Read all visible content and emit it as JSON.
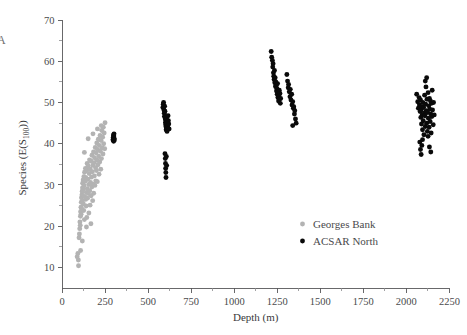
{
  "panel": {
    "label": "A"
  },
  "chart_data": {
    "type": "scatter",
    "title": "",
    "xlabel": "Depth (m)",
    "ylabel_main": "Species (E(S",
    "ylabel_sub": "100",
    "ylabel_tail": "))",
    "ylabel_full": "Species (E(S100))",
    "xlim": [
      0,
      2300
    ],
    "ylim": [
      5,
      71
    ],
    "grid": false,
    "legend_position": "inside-lower-right",
    "xticks": [
      0,
      250,
      500,
      750,
      1000,
      1250,
      1500,
      1750,
      2000,
      2250
    ],
    "xtick_labels": [
      "0",
      "250",
      "500",
      "750",
      "1000",
      "1250",
      "1500",
      "1750",
      "2000",
      "2250"
    ],
    "yticks": [
      10,
      20,
      30,
      40,
      50,
      60,
      70
    ],
    "ytick_labels": [
      "10",
      "20",
      "30",
      "40",
      "50",
      "60",
      "70"
    ],
    "yminor": [
      15,
      25,
      35,
      45,
      55,
      65
    ],
    "series": [
      {
        "name": "Georges Bank",
        "color": "#b3b3b3",
        "marker": "circle",
        "points": [
          [
            88,
            12.6
          ],
          [
            92,
            13.4
          ],
          [
            96,
            10.4
          ],
          [
            99,
            17.2
          ],
          [
            101,
            18.1
          ],
          [
            103,
            19.4
          ],
          [
            104,
            21.0
          ],
          [
            106,
            20.2
          ],
          [
            107,
            22.4
          ],
          [
            108,
            23.5
          ],
          [
            110,
            24.6
          ],
          [
            111,
            22.9
          ],
          [
            112,
            25.8
          ],
          [
            113,
            26.9
          ],
          [
            114,
            24.2
          ],
          [
            116,
            27.6
          ],
          [
            117,
            28.4
          ],
          [
            118,
            26.1
          ],
          [
            119,
            29.3
          ],
          [
            120,
            30.4
          ],
          [
            122,
            28.9
          ],
          [
            123,
            31.2
          ],
          [
            124,
            25.4
          ],
          [
            126,
            23.8
          ],
          [
            127,
            32.0
          ],
          [
            128,
            29.8
          ],
          [
            130,
            21.6
          ],
          [
            131,
            33.1
          ],
          [
            132,
            27.2
          ],
          [
            134,
            30.9
          ],
          [
            136,
            34.0
          ],
          [
            137,
            26.5
          ],
          [
            138,
            31.8
          ],
          [
            140,
            24.9
          ],
          [
            141,
            28.2
          ],
          [
            143,
            33.6
          ],
          [
            144,
            22.1
          ],
          [
            146,
            35.2
          ],
          [
            147,
            29.1
          ],
          [
            148,
            26.8
          ],
          [
            150,
            31.4
          ],
          [
            152,
            34.6
          ],
          [
            153,
            27.9
          ],
          [
            155,
            30.1
          ],
          [
            156,
            23.2
          ],
          [
            158,
            32.8
          ],
          [
            160,
            36.1
          ],
          [
            161,
            28.6
          ],
          [
            163,
            25.1
          ],
          [
            164,
            33.9
          ],
          [
            166,
            30.6
          ],
          [
            168,
            35.8
          ],
          [
            169,
            27.4
          ],
          [
            171,
            31.9
          ],
          [
            173,
            29.5
          ],
          [
            174,
            37.2
          ],
          [
            176,
            33.2
          ],
          [
            178,
            26.2
          ],
          [
            179,
            34.8
          ],
          [
            181,
            30.2
          ],
          [
            183,
            38.0
          ],
          [
            184,
            28.0
          ],
          [
            186,
            35.4
          ],
          [
            188,
            32.2
          ],
          [
            189,
            36.6
          ],
          [
            191,
            29.9
          ],
          [
            193,
            39.1
          ],
          [
            195,
            34.2
          ],
          [
            196,
            31.0
          ],
          [
            198,
            37.8
          ],
          [
            200,
            33.5
          ],
          [
            202,
            40.2
          ],
          [
            204,
            36.0
          ],
          [
            205,
            30.8
          ],
          [
            207,
            38.6
          ],
          [
            209,
            34.9
          ],
          [
            211,
            41.1
          ],
          [
            213,
            37.0
          ],
          [
            215,
            32.6
          ],
          [
            217,
            39.6
          ],
          [
            219,
            35.6
          ],
          [
            221,
            42.0
          ],
          [
            223,
            38.2
          ],
          [
            225,
            33.8
          ],
          [
            227,
            40.8
          ],
          [
            229,
            36.4
          ],
          [
            231,
            43.2
          ],
          [
            233,
            39.0
          ],
          [
            236,
            41.6
          ],
          [
            238,
            37.5
          ],
          [
            240,
            44.0
          ],
          [
            242,
            40.0
          ],
          [
            245,
            42.6
          ],
          [
            248,
            38.8
          ],
          [
            250,
            45.1
          ],
          [
            168,
            20.6
          ],
          [
            142,
            19.8
          ],
          [
            108,
            14.1
          ],
          [
            95,
            11.8
          ],
          [
            118,
            16.4
          ],
          [
            130,
            37.9
          ],
          [
            152,
            41.2
          ],
          [
            180,
            42.4
          ],
          [
            206,
            43.6
          ],
          [
            228,
            44.4
          ]
        ]
      },
      {
        "name": "ACSAR North",
        "color": "#0a0a0a",
        "marker": "circle",
        "points": [
          [
            296,
            41.0
          ],
          [
            298,
            41.6
          ],
          [
            299,
            42.1
          ],
          [
            300,
            40.6
          ],
          [
            301,
            41.9
          ],
          [
            302,
            42.4
          ],
          [
            303,
            41.3
          ],
          [
            304,
            40.9
          ],
          [
            586,
            48.8
          ],
          [
            588,
            49.6
          ],
          [
            590,
            50.0
          ],
          [
            592,
            48.2
          ],
          [
            594,
            47.4
          ],
          [
            595,
            46.6
          ],
          [
            596,
            49.1
          ],
          [
            598,
            47.9
          ],
          [
            600,
            46.0
          ],
          [
            601,
            45.2
          ],
          [
            602,
            44.6
          ],
          [
            603,
            45.8
          ],
          [
            604,
            44.1
          ],
          [
            605,
            43.4
          ],
          [
            606,
            45.0
          ],
          [
            607,
            43.8
          ],
          [
            608,
            46.3
          ],
          [
            609,
            44.9
          ],
          [
            610,
            43.0
          ],
          [
            612,
            45.5
          ],
          [
            614,
            44.3
          ],
          [
            616,
            46.8
          ],
          [
            618,
            45.6
          ],
          [
            620,
            44.8
          ],
          [
            622,
            43.6
          ],
          [
            598,
            37.6
          ],
          [
            600,
            36.4
          ],
          [
            601,
            35.2
          ],
          [
            602,
            34.0
          ],
          [
            603,
            33.0
          ],
          [
            604,
            31.8
          ],
          [
            606,
            36.9
          ],
          [
            608,
            34.7
          ],
          [
            1215,
            62.4
          ],
          [
            1218,
            61.0
          ],
          [
            1222,
            60.2
          ],
          [
            1224,
            58.6
          ],
          [
            1226,
            59.4
          ],
          [
            1228,
            57.2
          ],
          [
            1230,
            56.4
          ],
          [
            1232,
            55.6
          ],
          [
            1234,
            57.8
          ],
          [
            1236,
            54.8
          ],
          [
            1238,
            56.0
          ],
          [
            1240,
            53.9
          ],
          [
            1242,
            55.0
          ],
          [
            1244,
            54.2
          ],
          [
            1246,
            52.8
          ],
          [
            1248,
            53.4
          ],
          [
            1250,
            52.0
          ],
          [
            1252,
            54.6
          ],
          [
            1254,
            51.2
          ],
          [
            1256,
            52.4
          ],
          [
            1258,
            50.4
          ],
          [
            1260,
            51.6
          ],
          [
            1262,
            53.0
          ],
          [
            1264,
            50.8
          ],
          [
            1266,
            52.2
          ],
          [
            1268,
            49.8
          ],
          [
            1270,
            51.0
          ],
          [
            1306,
            56.8
          ],
          [
            1310,
            55.2
          ],
          [
            1314,
            53.6
          ],
          [
            1316,
            54.4
          ],
          [
            1320,
            52.6
          ],
          [
            1324,
            51.4
          ],
          [
            1326,
            53.2
          ],
          [
            1330,
            50.6
          ],
          [
            1334,
            52.0
          ],
          [
            1336,
            49.4
          ],
          [
            1340,
            50.2
          ],
          [
            1344,
            48.6
          ],
          [
            1346,
            49.0
          ],
          [
            1350,
            47.2
          ],
          [
            1352,
            48.0
          ],
          [
            1356,
            46.0
          ],
          [
            1360,
            45.0
          ],
          [
            1340,
            44.4
          ],
          [
            2060,
            52.0
          ],
          [
            2066,
            50.2
          ],
          [
            2070,
            48.6
          ],
          [
            2074,
            51.2
          ],
          [
            2076,
            49.4
          ],
          [
            2080,
            47.8
          ],
          [
            2082,
            50.6
          ],
          [
            2084,
            46.4
          ],
          [
            2086,
            48.2
          ],
          [
            2088,
            44.8
          ],
          [
            2090,
            49.0
          ],
          [
            2092,
            47.0
          ],
          [
            2094,
            43.4
          ],
          [
            2096,
            50.0
          ],
          [
            2098,
            45.6
          ],
          [
            2100,
            48.8
          ],
          [
            2102,
            42.2
          ],
          [
            2104,
            47.4
          ],
          [
            2106,
            51.8
          ],
          [
            2108,
            46.8
          ],
          [
            2110,
            44.2
          ],
          [
            2112,
            49.6
          ],
          [
            2114,
            53.8
          ],
          [
            2116,
            48.0
          ],
          [
            2118,
            45.0
          ],
          [
            2120,
            50.8
          ],
          [
            2122,
            43.0
          ],
          [
            2124,
            47.6
          ],
          [
            2126,
            52.4
          ],
          [
            2128,
            46.2
          ],
          [
            2130,
            49.2
          ],
          [
            2132,
            44.0
          ],
          [
            2134,
            51.0
          ],
          [
            2136,
            48.4
          ],
          [
            2138,
            45.4
          ],
          [
            2140,
            50.4
          ],
          [
            2142,
            47.2
          ],
          [
            2144,
            42.6
          ],
          [
            2146,
            49.8
          ],
          [
            2148,
            46.6
          ],
          [
            2150,
            53.0
          ],
          [
            2152,
            48.2
          ],
          [
            2156,
            44.6
          ],
          [
            2158,
            50.0
          ],
          [
            2162,
            47.0
          ],
          [
            2078,
            40.4
          ],
          [
            2082,
            38.6
          ],
          [
            2086,
            37.4
          ],
          [
            2090,
            39.6
          ],
          [
            2094,
            41.0
          ],
          [
            2110,
            55.2
          ],
          [
            2118,
            56.0
          ],
          [
            2126,
            41.8
          ],
          [
            2134,
            39.2
          ],
          [
            2142,
            38.0
          ]
        ]
      }
    ],
    "legend": [
      {
        "label": "Georges Bank",
        "color": "#b3b3b3"
      },
      {
        "label": "ACSAR North",
        "color": "#0a0a0a"
      }
    ]
  }
}
